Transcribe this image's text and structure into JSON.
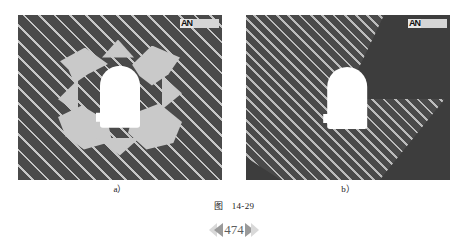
{
  "figure": {
    "caption_label": "图",
    "caption_number": "14-29",
    "panels": [
      {
        "id": "a",
        "sub_label": "a）",
        "watermark": "ANSYS",
        "watermark_glyph": "AN",
        "background_color": "#4a4a4a",
        "hatch_color": "#cdcdcd",
        "opening_color": "#ffffff",
        "plastic_zone_color": "#c9c9c9",
        "description": "hatched rock mass with butterfly-shaped plastic zone around arched tunnel opening"
      },
      {
        "id": "b",
        "sub_label": "b）",
        "watermark": "ANSYS",
        "watermark_glyph": "AN",
        "background_color": "#4a4a4a",
        "hatch_color": "#cdcdcd",
        "opening_color": "#ffffff",
        "wedge_color": "#3d3d3d",
        "description": "hatched rock mass with unhatched dark wedges and arched tunnel opening, no plastic zone"
      }
    ]
  },
  "footer": {
    "page_number": "474",
    "left_arrow_icon": "double-chevron-left",
    "right_arrow_icon": "double-chevron-right"
  }
}
